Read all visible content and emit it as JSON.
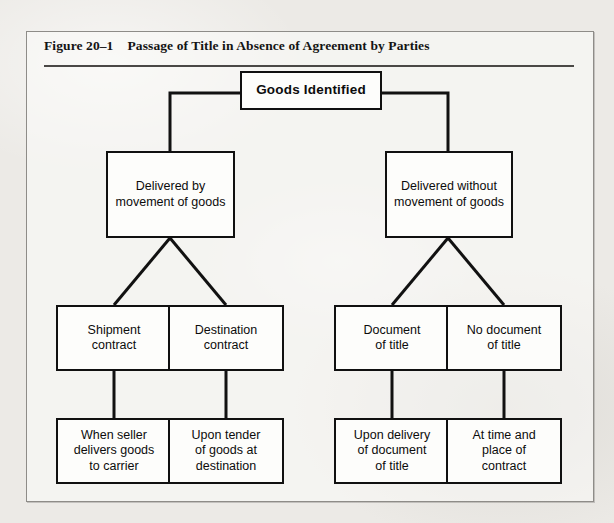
{
  "figure": {
    "number": "Figure 20–1",
    "title": "Passage of Title in Absence of Agreement by Parties"
  },
  "chart_data": {
    "type": "diagram",
    "title": "Passage of Title in Absence of Agreement by Parties",
    "orientation": "top-down",
    "levels": 4
  },
  "nodes": {
    "root": "Goods Identified",
    "l2_left": "Delivered by\nmovement of goods",
    "l2_right": "Delivered without\nmovement of goods",
    "l3_a": "Shipment\ncontract",
    "l3_b": "Destination\ncontract",
    "l3_c": "Document\nof title",
    "l3_d": "No document\nof title",
    "l4_a": "When seller\ndelivers goods\nto carrier",
    "l4_b": "Upon tender\nof goods at\ndestination",
    "l4_c": "Upon delivery\nof document\nof title",
    "l4_d": "At time and\nplace of\ncontract"
  },
  "colors": {
    "ink": "#101010",
    "box_fill": "#fdfdfb",
    "paper": "#eceae6",
    "frame": "#8e8c88"
  }
}
